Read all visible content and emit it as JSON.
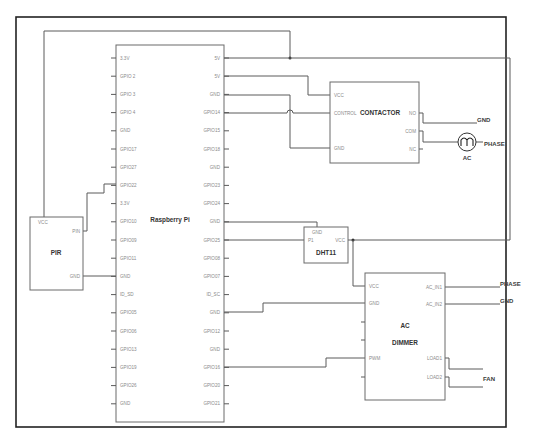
{
  "diagram": {
    "frame": {
      "outer_stroke": "#222222",
      "wire_color": "#5a5a5a"
    },
    "raspberry_pi": {
      "title": "Raspberry Pi",
      "left_pins": [
        "3.3V",
        "GPIO 2",
        "GPIO 3",
        "GPIO 4",
        "GND",
        "GPIO17",
        "GPIO27",
        "GPIO22",
        "3.3V",
        "GPIO10",
        "GPIO09",
        "GPIO11",
        "GND",
        "ID_SD",
        "GPIO05",
        "GPIO06",
        "GPIO13",
        "GPIO19",
        "GPIO26",
        "GND"
      ],
      "right_pins": [
        "5V",
        "5V",
        "GND",
        "GPIO14",
        "GPIO15",
        "GPIO18",
        "GND",
        "GPIO23",
        "GPIO24",
        "GND",
        "GPIO25",
        "GPIO08",
        "GPIO07",
        "ID_SC",
        "GND",
        "GPIO12",
        "GND",
        "GPIO16",
        "GPIO20",
        "GPIO21"
      ]
    },
    "pir": {
      "title": "PIR",
      "pins": {
        "vcc": "VCC",
        "pin": "PIN",
        "gnd": "GND"
      }
    },
    "contactor": {
      "title": "CONTACTOR",
      "left_pins": [
        "VCC",
        "CONTROL",
        "GND"
      ],
      "right_pins": [
        "NO",
        "COM",
        "NC"
      ]
    },
    "ac_source": {
      "label": "AC",
      "icon": "ac-source-icon"
    },
    "dht11": {
      "title": "DHT11",
      "pins": {
        "gnd": "GND",
        "p1": "P1",
        "vcc": "VCC"
      }
    },
    "ac_dimmer": {
      "title_line1": "AC",
      "title_line2": "DIMMER",
      "left_pins": [
        "VCC",
        "GND",
        "PWM"
      ],
      "right_pins": [
        "AC_IN1",
        "AC_IN2",
        "LOAD1",
        "LOAD2"
      ]
    },
    "external_labels": {
      "contactor_gnd": "GND",
      "contactor_phase": "PHASE",
      "dimmer_phase": "PHASE",
      "dimmer_gnd": "GND",
      "fan": "FAN"
    }
  }
}
